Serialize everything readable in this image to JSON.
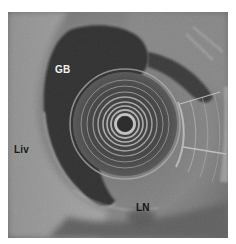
{
  "image": {
    "type": "endoscopic-ultrasound",
    "labels": {
      "gallbladder": "GB",
      "liver": "Liv",
      "lymph_node": "LN"
    },
    "colors": {
      "background": "#ffffff",
      "tissue_mid": "#7a7a7a",
      "tissue_light": "#b5b5b5",
      "anechoic": "#0a0a0a",
      "ring": "#d9d9d9",
      "label_light": "#f2f2f2",
      "label_dark": "#1a1a1a"
    }
  }
}
